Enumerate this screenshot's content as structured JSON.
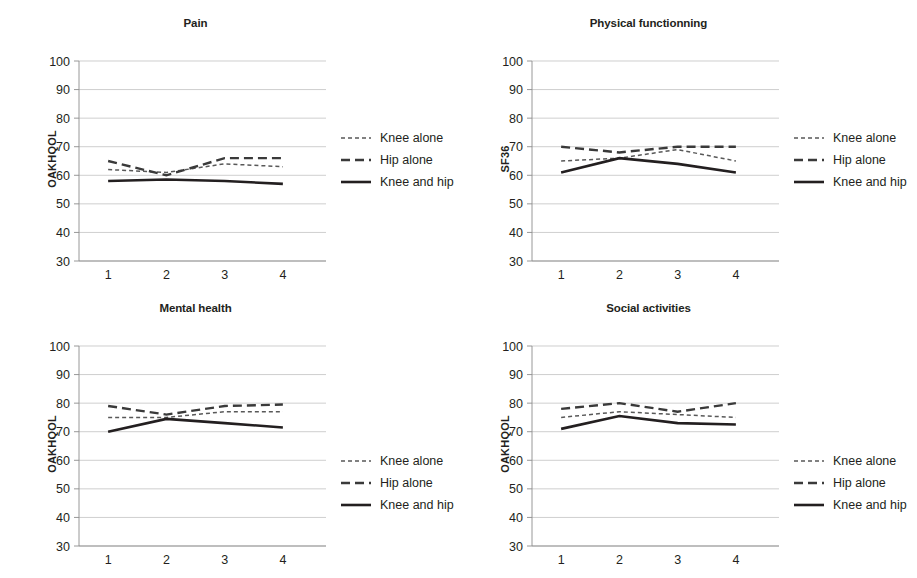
{
  "figure": {
    "background": "#ffffff",
    "line_color": "#231f20",
    "grid_color": "#b9b9b9"
  },
  "series_styles": [
    {
      "key": "knee_alone",
      "label": "Knee alone",
      "style": "dotted"
    },
    {
      "key": "hip_alone",
      "label": "Hip alone",
      "style": "dashed"
    },
    {
      "key": "knee_and_hip",
      "label": "Knee and hip",
      "style": "solid"
    }
  ],
  "chart_data": [
    {
      "type": "line",
      "title": "Pain",
      "xlabel": "",
      "ylabel": "OAKHQOL",
      "x": [
        1,
        2,
        3,
        4
      ],
      "categories": [
        "1",
        "2",
        "3",
        "4"
      ],
      "xtick_labels": [
        "1",
        "2",
        "3",
        "4"
      ],
      "ytick_labels": [
        "30",
        "40",
        "50",
        "60",
        "70",
        "80",
        "90",
        "100"
      ],
      "ylim": [
        30,
        100
      ],
      "ytick_step": 10,
      "grid": true,
      "legend_position": "right",
      "series": [
        {
          "name": "Knee alone",
          "values": [
            62,
            61,
            64,
            63
          ]
        },
        {
          "name": "Hip alone",
          "values": [
            65,
            60,
            66,
            66
          ]
        },
        {
          "name": "Knee and hip",
          "values": [
            58,
            58.5,
            58,
            57
          ]
        }
      ]
    },
    {
      "type": "line",
      "title": "Physical functionning",
      "xlabel": "",
      "ylabel": "SF36",
      "x": [
        1,
        2,
        3,
        4
      ],
      "categories": [
        "1",
        "2",
        "3",
        "4"
      ],
      "xtick_labels": [
        "1",
        "2",
        "3",
        "4"
      ],
      "ytick_labels": [
        "30",
        "40",
        "50",
        "60",
        "70",
        "80",
        "90",
        "100"
      ],
      "ylim": [
        30,
        100
      ],
      "ytick_step": 10,
      "grid": true,
      "legend_position": "right",
      "series": [
        {
          "name": "Knee alone",
          "values": [
            65,
            66,
            69,
            65
          ]
        },
        {
          "name": "Hip alone",
          "values": [
            70,
            68,
            70,
            70
          ]
        },
        {
          "name": "Knee and hip",
          "values": [
            61,
            66,
            64,
            61
          ]
        }
      ]
    },
    {
      "type": "line",
      "title": "Mental health",
      "xlabel": "",
      "ylabel": "OAKHQOL",
      "x": [
        1,
        2,
        3,
        4
      ],
      "categories": [
        "1",
        "2",
        "3",
        "4"
      ],
      "xtick_labels": [
        "1",
        "2",
        "3",
        "4"
      ],
      "ytick_labels": [
        "30",
        "40",
        "50",
        "60",
        "70",
        "80",
        "90",
        "100"
      ],
      "ylim": [
        30,
        100
      ],
      "ytick_step": 10,
      "grid": true,
      "legend_position": "right",
      "series": [
        {
          "name": "Knee alone",
          "values": [
            75,
            75,
            77,
            77
          ]
        },
        {
          "name": "Hip alone",
          "values": [
            79,
            76,
            79,
            79.5
          ]
        },
        {
          "name": "Knee and hip",
          "values": [
            70,
            74.5,
            73,
            71.5
          ]
        }
      ]
    },
    {
      "type": "line",
      "title": "Social activities",
      "xlabel": "",
      "ylabel": "OAKHQOL",
      "x": [
        1,
        2,
        3,
        4
      ],
      "categories": [
        "1",
        "2",
        "3",
        "4"
      ],
      "xtick_labels": [
        "1",
        "2",
        "3",
        "4"
      ],
      "ytick_labels": [
        "30",
        "40",
        "50",
        "60",
        "70",
        "80",
        "90",
        "100"
      ],
      "ylim": [
        30,
        100
      ],
      "ytick_step": 10,
      "grid": true,
      "legend_position": "right",
      "series": [
        {
          "name": "Knee alone",
          "values": [
            75,
            77,
            76,
            75
          ]
        },
        {
          "name": "Hip alone",
          "values": [
            78,
            80,
            77,
            80
          ]
        },
        {
          "name": "Knee and hip",
          "values": [
            71,
            75.5,
            73,
            72.5
          ]
        }
      ]
    }
  ]
}
